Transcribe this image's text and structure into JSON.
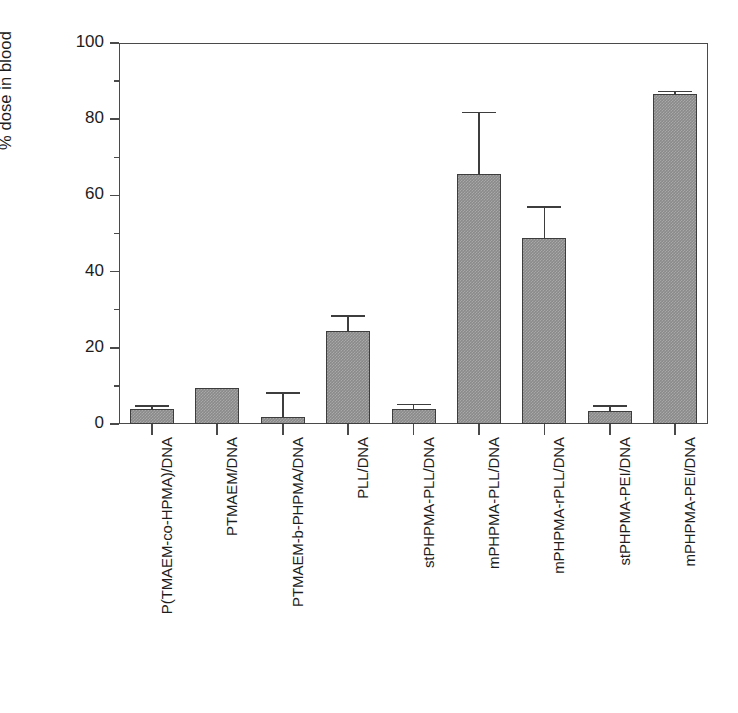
{
  "chart_data": {
    "type": "bar",
    "title": "",
    "xlabel": "",
    "ylabel": "% dose in blood",
    "ylim": [
      0,
      100
    ],
    "ymajor_ticks": [
      0,
      20,
      40,
      60,
      80,
      100
    ],
    "yminor_ticks": [
      10,
      30,
      50,
      70,
      90
    ],
    "ytick_labels": [
      "0",
      "20",
      "40",
      "60",
      "80",
      "100"
    ],
    "grid": false,
    "legend": "none",
    "bar_color": "#8a8a8a",
    "bar_edge_color": "#3d3d3d",
    "categories": [
      "P(TMAEM-co-HPMA)/DNA",
      "PTMAEM/DNA",
      "PTMAEM-b-PHPMA/DNA",
      "PLL/DNA",
      "stPHPMA-PLL/DNA",
      "mPHPMA-PLL/DNA",
      "mPHPMA-rPLL/DNA",
      "stPHPMA-PEI/DNA",
      "mPHPMA-PEI/DNA"
    ],
    "values": [
      4.0,
      9.5,
      1.8,
      24.5,
      4.0,
      65.5,
      48.7,
      3.5,
      86.5
    ],
    "errors": [
      1.0,
      0.0,
      6.5,
      4.0,
      1.3,
      16.5,
      8.5,
      1.5,
      1.0
    ],
    "series": [
      {
        "name": "% dose in blood",
        "values": [
          4.0,
          9.5,
          1.8,
          24.5,
          4.0,
          65.5,
          48.7,
          3.5,
          86.5
        ],
        "errors": [
          1.0,
          0.0,
          6.5,
          4.0,
          1.3,
          16.5,
          8.5,
          1.5,
          1.0
        ]
      }
    ]
  }
}
